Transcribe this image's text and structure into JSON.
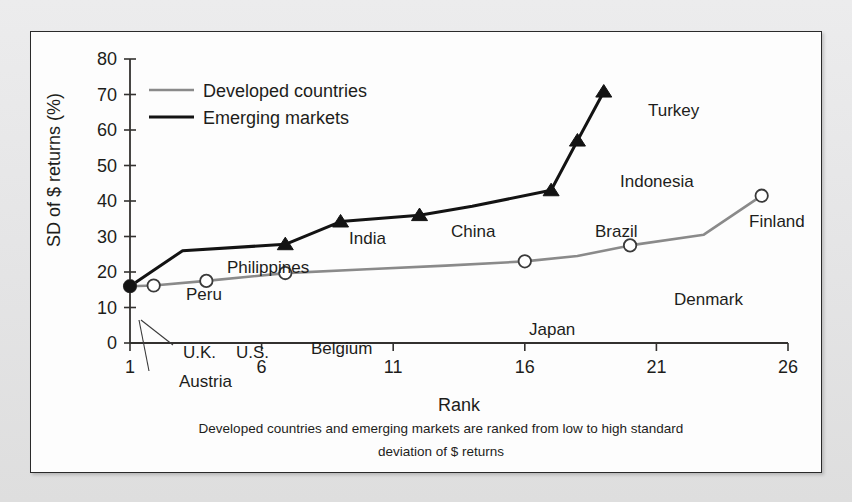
{
  "chart_data": {
    "type": "line",
    "title": "",
    "xlabel": "Rank",
    "ylabel": "SD of $ returns (%)",
    "xlim": [
      1,
      26
    ],
    "ylim": [
      0,
      80
    ],
    "xticks": [
      "1",
      "6",
      "11",
      "16",
      "21",
      "26"
    ],
    "xtick_values": [
      1,
      6,
      11,
      16,
      21,
      26
    ],
    "yticks": [
      "0",
      "10",
      "20",
      "30",
      "40",
      "50",
      "60",
      "70",
      "80"
    ],
    "ytick_values": [
      0,
      10,
      20,
      30,
      40,
      50,
      60,
      70,
      80
    ],
    "grid": false,
    "legend_position": "top-left",
    "caption": "Developed countries and emerging markets are ranked from low to high standard deviation of $ returns",
    "caption_line1": "Developed countries and emerging markets are ranked from low to high standard",
    "caption_line2": "deviation of $ returns",
    "series": [
      {
        "name": "Developed countries",
        "color": "#8a8a8a",
        "marker": "open-circle",
        "x": [
          1,
          1.9,
          3.9,
          6.9,
          10.0,
          13.0,
          16.0,
          18.0,
          20.0,
          22.8,
          25.0
        ],
        "values": [
          16.0,
          16.2,
          17.5,
          19.7,
          20.8,
          21.8,
          23.0,
          24.5,
          27.5,
          30.5,
          41.5
        ],
        "labeled_points": [
          {
            "label": "Austria",
            "rank": 1,
            "value": 16.0
          },
          {
            "label": "U.K.",
            "rank": 1.9,
            "value": 16.2
          },
          {
            "label": "U.S.",
            "rank": 3.9,
            "value": 17.5
          },
          {
            "label": "Belgium",
            "rank": 6.9,
            "value": 19.7
          },
          {
            "label": "Japan",
            "rank": 16.0,
            "value": 23.0
          },
          {
            "label": "Denmark",
            "rank": 20.0,
            "value": 27.5
          },
          {
            "label": "Finland",
            "rank": 25.0,
            "value": 41.5
          }
        ]
      },
      {
        "name": "Emerging markets",
        "color": "#131313",
        "marker": "triangle",
        "x": [
          1,
          3.0,
          6.9,
          9.0,
          12.0,
          14.0,
          17.0,
          18.0,
          19.0
        ],
        "values": [
          16.0,
          26.0,
          27.8,
          34.2,
          36.0,
          38.5,
          43.0,
          57.0,
          70.8
        ],
        "labeled_points": [
          {
            "label": "Peru",
            "rank": 1,
            "value": 16.0
          },
          {
            "label": "Philippines",
            "rank": 6.9,
            "value": 27.8
          },
          {
            "label": "India",
            "rank": 9.0,
            "value": 34.2
          },
          {
            "label": "China",
            "rank": 12.0,
            "value": 36.0
          },
          {
            "label": "Brazil",
            "rank": 17.0,
            "value": 43.0
          },
          {
            "label": "Indonesia",
            "rank": 18.0,
            "value": 57.0
          },
          {
            "label": "Turkey",
            "rank": 19.0,
            "value": 70.8
          }
        ]
      }
    ],
    "annotations": [
      {
        "text": "Peru",
        "x": 155,
        "y": 268,
        "anchor": "start"
      },
      {
        "text": "Philippines",
        "x": 196,
        "y": 241,
        "anchor": "start"
      },
      {
        "text": "India",
        "x": 318,
        "y": 212,
        "anchor": "start"
      },
      {
        "text": "China",
        "x": 420,
        "y": 205,
        "anchor": "start"
      },
      {
        "text": "Turkey",
        "x": 617,
        "y": 84,
        "anchor": "start"
      },
      {
        "text": "Indonesia",
        "x": 589,
        "y": 155,
        "anchor": "start"
      },
      {
        "text": "Brazil",
        "x": 564,
        "y": 205,
        "anchor": "start"
      },
      {
        "text": "Finland",
        "x": 718,
        "y": 195,
        "anchor": "start"
      },
      {
        "text": "Denmark",
        "x": 643,
        "y": 273,
        "anchor": "start"
      },
      {
        "text": "Japan",
        "x": 498,
        "y": 303,
        "anchor": "start"
      },
      {
        "text": "U.K.",
        "x": 152,
        "y": 326,
        "anchor": "start"
      },
      {
        "text": "U.S.",
        "x": 205,
        "y": 326,
        "anchor": "start"
      },
      {
        "text": "Austria",
        "x": 148,
        "y": 355,
        "anchor": "start"
      },
      {
        "text": "Belgium",
        "x": 280,
        "y": 322,
        "anchor": "start"
      }
    ]
  },
  "legend": {
    "items": [
      {
        "label": "Developed countries",
        "color": "#8a8a8a"
      },
      {
        "label": "Emerging markets",
        "color": "#131313"
      }
    ]
  }
}
